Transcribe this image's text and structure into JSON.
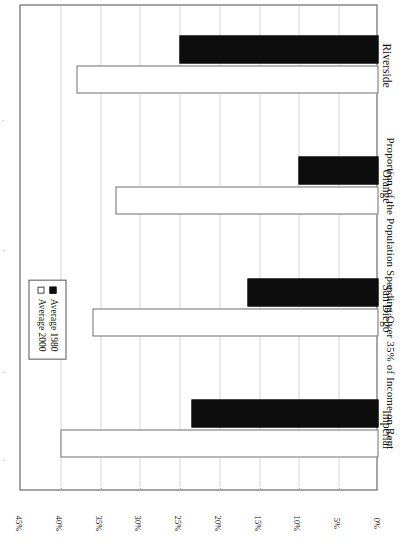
{
  "chart_data": {
    "type": "bar",
    "orientation": "horizontal",
    "title": "",
    "subtitle": "",
    "xlabel": "Proportion of the Population Spending Over 35% of Income on Rent",
    "ylabel": "",
    "categories": [
      "Imperial",
      "San Diego",
      "Orange",
      "Riverside"
    ],
    "series": [
      {
        "name": "Average 1980",
        "values": [
          23.5,
          16.5,
          10.0,
          25.0
        ],
        "color": "#0d0d0d",
        "marker": "filled-square"
      },
      {
        "name": "Average 2000",
        "values": [
          40.0,
          36.0,
          33.0,
          38.0
        ],
        "color": "#ffffff",
        "marker": "hollow-square"
      }
    ],
    "value_axis": {
      "min": 0,
      "max": 45,
      "tick_step": 5,
      "tick_labels": [
        "0%",
        "5%",
        "10%",
        "15%",
        "20%",
        "25%",
        "30%",
        "35%",
        "40%",
        "45%"
      ],
      "tick_values": [
        0,
        5,
        10,
        15,
        20,
        25,
        30,
        35,
        40,
        45
      ],
      "unit": "%"
    },
    "grid": {
      "value_axis_gridlines": true,
      "style": "dotted",
      "color": "#aaaaaa"
    },
    "legend": {
      "position": "inside-left",
      "entries": [
        "Average 1980",
        "Average 2000"
      ]
    }
  },
  "axis": {
    "value_title": "Proportion of the Population Spending Over 35% of Income on Rent"
  },
  "legend": {
    "entries": [
      {
        "label": "Average 1980"
      },
      {
        "label": "Average 2000"
      }
    ]
  },
  "categories": [
    {
      "label": "Imperial"
    },
    {
      "label": "San Diego"
    },
    {
      "label": "Orange"
    },
    {
      "label": "Riverside"
    }
  ],
  "ticks": [
    {
      "label": "0%"
    },
    {
      "label": "5%"
    },
    {
      "label": "10%"
    },
    {
      "label": "15%"
    },
    {
      "label": "20%"
    },
    {
      "label": "25%"
    },
    {
      "label": "30%"
    },
    {
      "label": "35%"
    },
    {
      "label": "40%"
    },
    {
      "label": "45%"
    }
  ]
}
